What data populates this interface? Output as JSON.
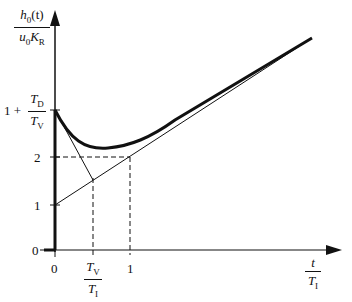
{
  "diagram": {
    "y_axis_label": {
      "numerator": "h0(t)",
      "denominator": "u0 KR"
    },
    "x_axis_label": {
      "numerator": "t",
      "denominator": "TI"
    },
    "y_ticks": [
      {
        "label": "0",
        "value": 0
      },
      {
        "label": "1",
        "value": 1
      },
      {
        "label": "2",
        "value": 2
      },
      {
        "label": "1 + TD/TV",
        "value": 2.9
      }
    ],
    "x_ticks": [
      {
        "label": "0",
        "value": 0
      },
      {
        "label": "TV/TI",
        "value": 0.5
      },
      {
        "label": "1",
        "value": 1
      }
    ],
    "curves": [
      {
        "name": "step response h0(t)",
        "style": "thick"
      },
      {
        "name": "asymptote 1 + t/TI",
        "style": "thin"
      },
      {
        "name": "initial tangent",
        "style": "thin"
      }
    ],
    "guides": "dashed lines at y=2 and x=TV/TI, x=1"
  },
  "labels": {
    "y_num": "h",
    "y_num_sub": "0",
    "y_num_rest": "(t)",
    "y_den": "u",
    "y_den_sub": "0",
    "y_den_k": "K",
    "y_den_ksub": "R",
    "tick_y0": "0",
    "tick_y1": "1",
    "tick_y2": "2",
    "tick_y3_prefix": "1 +",
    "tick_y3_num": "T",
    "tick_y3_num_sub": "D",
    "tick_y3_den": "T",
    "tick_y3_den_sub": "V",
    "tick_x0": "0",
    "tick_x1": "1",
    "tick_xv_num": "T",
    "tick_xv_num_sub": "V",
    "tick_xv_den": "T",
    "tick_xv_den_sub": "I",
    "x_num": "t",
    "x_den": "T",
    "x_den_sub": "I"
  }
}
